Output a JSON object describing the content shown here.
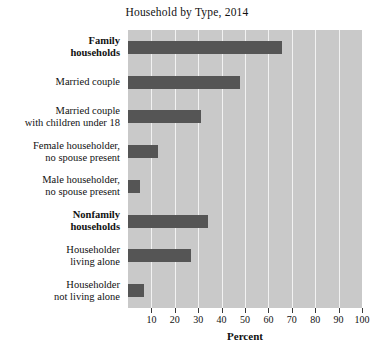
{
  "chart_data": {
    "type": "bar",
    "orientation": "horizontal",
    "title": "Household by Type, 2014",
    "xlabel": "Percent",
    "ylabel": "",
    "xlim": [
      0,
      100
    ],
    "xticks": [
      10,
      20,
      30,
      40,
      50,
      60,
      70,
      80,
      90,
      100
    ],
    "grid": true,
    "legend": "none",
    "background_color": "#c9c9c9",
    "bar_color": "#555555",
    "gridline_color": "#f2f2f2",
    "categories": [
      "Family households",
      "Married couple",
      "Married couple with children under 18",
      "Female householder, no spouse present",
      "Male householder, no spouse present",
      "Nonfamily households",
      "Householder living alone",
      "Householder not living alone"
    ],
    "values": [
      66,
      48,
      31,
      13,
      5,
      34,
      27,
      7
    ],
    "category_label_lines": [
      [
        "Family",
        "households"
      ],
      [
        "Married couple"
      ],
      [
        "Married couple",
        "with children under 18"
      ],
      [
        "Female householder,",
        "no spouse present"
      ],
      [
        "Male householder,",
        "no spouse present"
      ],
      [
        "Nonfamily",
        "households"
      ],
      [
        "Householder",
        "living alone"
      ],
      [
        "Householder",
        "not living alone"
      ]
    ],
    "category_label_bold": [
      true,
      false,
      false,
      false,
      false,
      true,
      false,
      false
    ]
  }
}
